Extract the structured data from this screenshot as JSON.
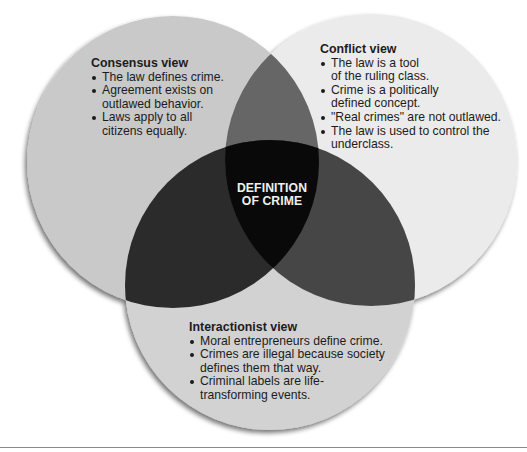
{
  "diagram": {
    "type": "venn",
    "center_label": {
      "line1": "DEFINITION",
      "line2": "OF CRIME"
    },
    "colors": {
      "consensus_fill": "#c9c9c9",
      "conflict_fill": "#ebebeb",
      "interactionist_fill": "#d2d2d2",
      "consensus_conflict_overlap": "#666666",
      "consensus_interactionist_overlap": "#2b2b2b",
      "conflict_interactionist_overlap": "#464646",
      "center_overlap": "#090909",
      "center_text": "#f0f0f0",
      "body_text": "#1c1c1c"
    },
    "sets": [
      {
        "id": "consensus",
        "title": "Consensus view",
        "bullets": [
          "The law defines crime.",
          "Agreement exists on\noutlawed behavior.",
          "Laws apply to all\ncitizens equally."
        ]
      },
      {
        "id": "conflict",
        "title": "Conflict view",
        "bullets": [
          "The law is a tool\nof the ruling class.",
          "Crime is a politically\ndefined concept.",
          "\"Real crimes\" are not outlawed.",
          "The law is used to control the\nunderclass."
        ]
      },
      {
        "id": "interactionist",
        "title": "Interactionist view",
        "bullets": [
          "Moral entrepreneurs define crime.",
          "Crimes are illegal because society\ndefines them that way.",
          "Criminal labels are life-\ntransforming events."
        ]
      }
    ]
  }
}
